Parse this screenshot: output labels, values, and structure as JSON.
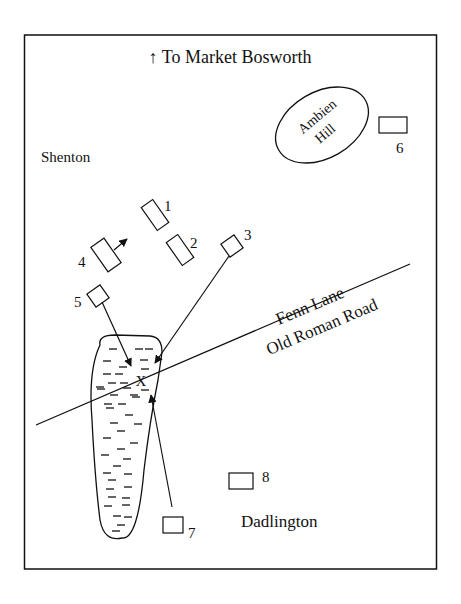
{
  "diagram": {
    "type": "battlefield map",
    "title": "↑ To Market Bosworth",
    "places": {
      "shenton": "Shenton",
      "dadlington": "Dadlington",
      "hill_line1": "Ambien",
      "hill_line2": "Hill"
    },
    "road": {
      "upper_label": "Fenn Lane",
      "lower_label": "Old Roman Road"
    },
    "markers": [
      {
        "id": "1",
        "label": "1"
      },
      {
        "id": "2",
        "label": "2"
      },
      {
        "id": "3",
        "label": "3"
      },
      {
        "id": "4",
        "label": "4"
      },
      {
        "id": "5",
        "label": "5"
      },
      {
        "id": "6",
        "label": "6"
      },
      {
        "id": "7",
        "label": "7"
      },
      {
        "id": "8",
        "label": "8"
      }
    ],
    "cross_mark": "X",
    "colors": {
      "ink": "#111111",
      "background": "#ffffff"
    }
  }
}
